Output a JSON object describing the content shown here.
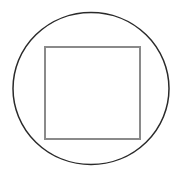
{
  "diagram": {
    "canvas": {
      "width": 180,
      "height": 170,
      "background": "#ffffff"
    },
    "shapes": [
      {
        "type": "ellipse",
        "name": "outer-circle",
        "cx": 91,
        "cy": 88.5,
        "rx": 78,
        "ry": 76,
        "stroke": "#2a2a2a",
        "stroke_width": 1.5,
        "fill": "none"
      },
      {
        "type": "rect",
        "name": "inner-square",
        "x": 45,
        "y": 47,
        "width": 95,
        "height": 92,
        "stroke": "#8a8a8a",
        "stroke_width": 2,
        "fill": "none"
      }
    ]
  }
}
